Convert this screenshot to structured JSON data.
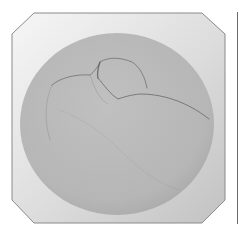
{
  "image": {
    "description": "Grayscale image of an octagonal tile with a light gradient border enclosing a gray circular disc bearing a faint sketched organic shape",
    "colors": {
      "background": "#ffffff",
      "tile_light": "#f2f2f2",
      "tile_dark": "#c4c4c4",
      "tile_border": "#8a8a8a",
      "disc": "#b9b9b9",
      "disc_edge": "#a8a8a8",
      "sketch_line": "#5c5c5c",
      "right_edge_line": "#6a6a6a"
    }
  }
}
